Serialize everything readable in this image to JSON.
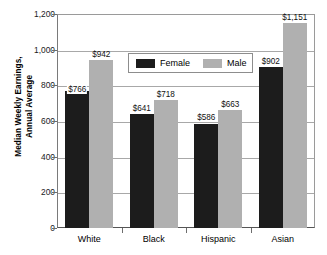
{
  "chart_data": {
    "type": "bar",
    "title": "",
    "xlabel": "",
    "ylabel_line1": "Median Weekly Earnings,",
    "ylabel_line2": "Annual Average",
    "categories": [
      "White",
      "Black",
      "Hispanic",
      "Asian"
    ],
    "series": [
      {
        "name": "Female",
        "color": "#1c1c1c",
        "values": [
          766,
          641,
          586,
          902
        ],
        "labels": [
          "$766",
          "$641",
          "$586",
          "$902"
        ]
      },
      {
        "name": "Male",
        "color": "#b0b0b0",
        "values": [
          942,
          718,
          663,
          1151
        ],
        "labels": [
          "$942",
          "$718",
          "$663",
          "$1,151"
        ]
      }
    ],
    "ylim": [
      0,
      1200
    ],
    "yticks": [
      0,
      200,
      400,
      600,
      800,
      1000,
      1200
    ],
    "ytick_labels": [
      "0",
      "200",
      "400",
      "600",
      "800",
      "1,000",
      "1,200"
    ],
    "grid": true,
    "legend_position": "upper-center"
  },
  "legend": {
    "female_label": "Female",
    "male_label": "Male"
  },
  "axis": {
    "y_title_line1": "Median Weekly Earnings,",
    "y_title_line2": "Annual Average"
  }
}
